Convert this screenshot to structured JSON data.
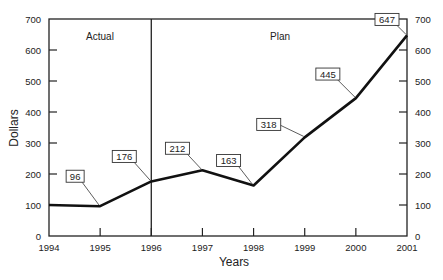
{
  "chart_data": {
    "type": "line",
    "title": "",
    "xlabel": "Years",
    "ylabel": "Dollars",
    "x": [
      1994,
      1995,
      1996,
      1997,
      1998,
      1999,
      2000,
      2001
    ],
    "series": [
      {
        "name": "Dollars",
        "values": [
          100,
          96,
          176,
          212,
          163,
          318,
          445,
          647
        ]
      }
    ],
    "data_labels": [
      {
        "x": 1995,
        "label": "96"
      },
      {
        "x": 1996,
        "label": "176"
      },
      {
        "x": 1997,
        "label": "212"
      },
      {
        "x": 1998,
        "label": "163"
      },
      {
        "x": 1999,
        "label": "318"
      },
      {
        "x": 2000,
        "label": "445"
      },
      {
        "x": 2001,
        "label": "647"
      }
    ],
    "ylim": [
      0,
      700
    ],
    "yticks": [
      0,
      100,
      200,
      300,
      400,
      500,
      600,
      700
    ],
    "xticks": [
      "1994",
      "1995",
      "1996",
      "1997",
      "1998",
      "1999",
      "2000",
      "2001"
    ],
    "annotations": [
      {
        "text": "Actual",
        "region": "1994-1996"
      },
      {
        "text": "Plan",
        "region": "1996-2001"
      }
    ],
    "divider_at": 1996,
    "grid": false,
    "legend": "none",
    "right_axis_mirrored": true
  }
}
